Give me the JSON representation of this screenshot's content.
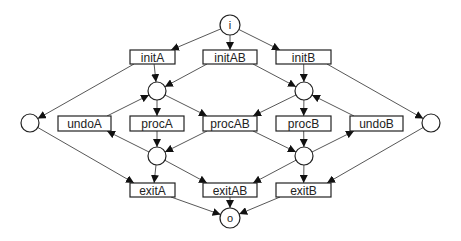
{
  "diagram": {
    "type": "petri-net",
    "colors": {
      "stroke": "#222222",
      "arc": "#444444",
      "background": "#ffffff"
    },
    "places": [
      {
        "id": "i",
        "label": "i",
        "cx": 230,
        "cy": 25,
        "r": 10
      },
      {
        "id": "pA1",
        "label": "",
        "cx": 157,
        "cy": 91,
        "r": 9
      },
      {
        "id": "pB1",
        "label": "",
        "cx": 304,
        "cy": 91,
        "r": 9
      },
      {
        "id": "pL",
        "label": "",
        "cx": 30,
        "cy": 123,
        "r": 9
      },
      {
        "id": "pR",
        "label": "",
        "cx": 431,
        "cy": 123,
        "r": 9
      },
      {
        "id": "pA2",
        "label": "",
        "cx": 157,
        "cy": 156,
        "r": 9
      },
      {
        "id": "pB2",
        "label": "",
        "cx": 304,
        "cy": 156,
        "r": 9
      },
      {
        "id": "o",
        "label": "o",
        "cx": 230,
        "cy": 218,
        "r": 10
      }
    ],
    "transitions": [
      {
        "id": "initA",
        "label": "initA",
        "x": 130,
        "y": 50,
        "w": 45,
        "h": 14
      },
      {
        "id": "initAB",
        "label": "initAB",
        "x": 203,
        "y": 50,
        "w": 54,
        "h": 14
      },
      {
        "id": "initB",
        "label": "initB",
        "x": 276,
        "y": 50,
        "w": 55,
        "h": 14
      },
      {
        "id": "undoA",
        "label": "undoA",
        "x": 58,
        "y": 116,
        "w": 53,
        "h": 15
      },
      {
        "id": "procA",
        "label": "procA",
        "x": 130,
        "y": 116,
        "w": 54,
        "h": 15
      },
      {
        "id": "procAB",
        "label": "procAB",
        "x": 203,
        "y": 116,
        "w": 54,
        "h": 15
      },
      {
        "id": "procB",
        "label": "procB",
        "x": 276,
        "y": 116,
        "w": 55,
        "h": 15
      },
      {
        "id": "undoB",
        "label": "undoB",
        "x": 350,
        "y": 116,
        "w": 53,
        "h": 15
      },
      {
        "id": "exitA",
        "label": "exitA",
        "x": 130,
        "y": 183,
        "w": 45,
        "h": 14
      },
      {
        "id": "exitAB",
        "label": "exitAB",
        "x": 203,
        "y": 183,
        "w": 54,
        "h": 14
      },
      {
        "id": "exitB",
        "label": "exitB",
        "x": 276,
        "y": 183,
        "w": 55,
        "h": 14
      }
    ],
    "arcs": [
      {
        "from": "i",
        "to": "initA"
      },
      {
        "from": "i",
        "to": "initAB"
      },
      {
        "from": "i",
        "to": "initB"
      },
      {
        "from": "initA",
        "to": "pA1"
      },
      {
        "from": "initA",
        "to": "pL"
      },
      {
        "from": "initAB",
        "to": "pA1"
      },
      {
        "from": "initAB",
        "to": "pB1"
      },
      {
        "from": "initB",
        "to": "pB1"
      },
      {
        "from": "initB",
        "to": "pR"
      },
      {
        "from": "pA1",
        "to": "procA"
      },
      {
        "from": "pA1",
        "to": "procAB"
      },
      {
        "from": "pB1",
        "to": "procB"
      },
      {
        "from": "pB1",
        "to": "procAB"
      },
      {
        "from": "undoA",
        "to": "pA1"
      },
      {
        "from": "undoB",
        "to": "pB1"
      },
      {
        "from": "procA",
        "to": "pA2"
      },
      {
        "from": "procAB",
        "to": "pA2"
      },
      {
        "from": "procAB",
        "to": "pB2"
      },
      {
        "from": "procB",
        "to": "pB2"
      },
      {
        "from": "pA2",
        "to": "undoA"
      },
      {
        "from": "pB2",
        "to": "undoB"
      },
      {
        "from": "pA2",
        "to": "exitA"
      },
      {
        "from": "pA2",
        "to": "exitAB"
      },
      {
        "from": "pB2",
        "to": "exitB"
      },
      {
        "from": "pB2",
        "to": "exitAB"
      },
      {
        "from": "pL",
        "to": "exitA"
      },
      {
        "from": "pR",
        "to": "exitB"
      },
      {
        "from": "exitA",
        "to": "o"
      },
      {
        "from": "exitAB",
        "to": "o"
      },
      {
        "from": "exitB",
        "to": "o"
      }
    ]
  }
}
